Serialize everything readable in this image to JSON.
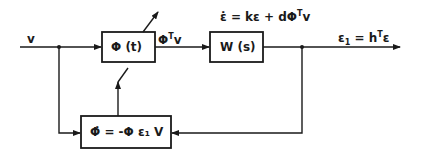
{
  "diagram": {
    "type": "block-diagram",
    "blocks": [
      {
        "id": "phi",
        "label": "Φ (t)"
      },
      {
        "id": "plant",
        "label": "W (s)"
      },
      {
        "id": "adapt",
        "label": "Φ̇ = -Φ ε₁ V"
      }
    ],
    "signals": {
      "input": "v",
      "phi_output": "ΦTv",
      "phi_output_main": "Φ",
      "phi_output_sup": "T",
      "phi_output_sub": "v",
      "state_eq_dot": "ε̇",
      "state_eq": "= kε + dΦ",
      "state_eq_sup": "T",
      "state_eq_end": "v",
      "output_lhs": "ε",
      "output_lhs_sub": "1",
      "output_mid": " = h",
      "output_sup": "T",
      "output_end": "ε"
    },
    "colors": {
      "line": "#1a1a1a",
      "background": "#ffffff"
    }
  }
}
